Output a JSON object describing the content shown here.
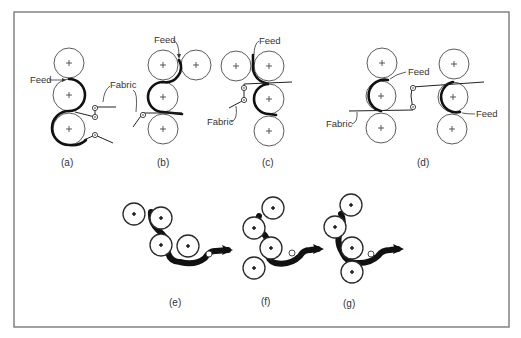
{
  "figure": {
    "panels": [
      {
        "id": "a",
        "caption": "(a)",
        "labels": {
          "feed": "Feed",
          "fabric": "Fabric"
        }
      },
      {
        "id": "b",
        "caption": "(b)",
        "labels": {
          "feed": "Feed",
          "fabric": "Fabric"
        }
      },
      {
        "id": "c",
        "caption": "(c)",
        "labels": {
          "feed": "Feed",
          "fabric": "Fabric"
        }
      },
      {
        "id": "d",
        "caption": "(d)",
        "labels": {
          "feed_left": "Feed",
          "feed_right": "Feed",
          "fabric": "Fabric"
        }
      },
      {
        "id": "e",
        "caption": "(e)"
      },
      {
        "id": "f",
        "caption": "(f)"
      },
      {
        "id": "g",
        "caption": "(g)"
      }
    ],
    "colors": {
      "frame": "#7a7a7a",
      "ink": "#111111",
      "background": "#ffffff"
    }
  }
}
